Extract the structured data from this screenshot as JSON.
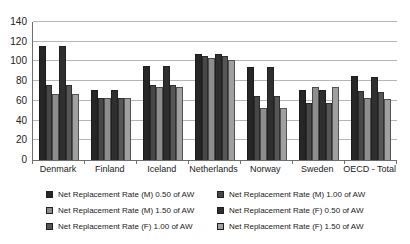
{
  "chart_data": {
    "type": "bar",
    "title": "",
    "xlabel": "",
    "ylabel": "",
    "categories": [
      "Denmark",
      "Finland",
      "Iceland",
      "Netherlands",
      "Norway",
      "Sweden",
      "OECD - Total"
    ],
    "series": [
      {
        "name": "Net Replacement Rate (M) 0.50 of AW",
        "color": "#262626",
        "values": [
          116,
          71,
          95,
          108,
          94,
          71,
          85
        ]
      },
      {
        "name": "Net Replacement Rate (M) 1.00 of AW",
        "color": "#474747",
        "values": [
          76,
          63,
          76,
          106,
          65,
          58,
          70
        ]
      },
      {
        "name": "Net Replacement Rate (M) 1.50 of AW",
        "color": "#8e8e8e",
        "values": [
          67,
          63,
          74,
          104,
          53,
          74,
          63
        ]
      },
      {
        "name": "Net Replacement Rate (F) 0.50 of AW",
        "color": "#2f2f2f",
        "values": [
          116,
          71,
          95,
          108,
          94,
          71,
          84
        ]
      },
      {
        "name": "Net Replacement Rate (F) 1.00 of AW",
        "color": "#565656",
        "values": [
          76,
          63,
          76,
          106,
          65,
          58,
          69
        ]
      },
      {
        "name": "Net Replacement Rate (F) 1.50 of AW",
        "color": "#a0a0a0",
        "values": [
          67,
          63,
          74,
          101,
          53,
          74,
          62
        ]
      }
    ],
    "ylim": [
      0,
      140
    ],
    "yticks": [
      0,
      20,
      40,
      60,
      80,
      100,
      120,
      140
    ],
    "grid": true,
    "legend_position": "bottom",
    "legend_columns": 2
  }
}
